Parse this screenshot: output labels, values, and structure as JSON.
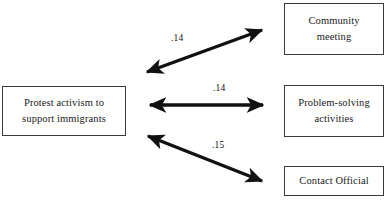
{
  "diagram": {
    "background_color": "#ffffff",
    "line_color": "#111111",
    "box_border_color": "#3a3a3a",
    "nodes": {
      "protest": {
        "line1": "Protest activism to",
        "line2": "support immigrants"
      },
      "community": {
        "line1": "Community",
        "line2": "meeting"
      },
      "problem": {
        "line1": "Problem-solving",
        "line2": "activities"
      },
      "contact": {
        "line1": "Contact Official",
        "line2": ""
      }
    },
    "edges": [
      {
        "id": "protest-community",
        "label": ".14",
        "from": "protest",
        "to": "community",
        "style": "double-headed-arrow",
        "direction": "diagonal-up-right"
      },
      {
        "id": "protest-problem",
        "label": ".14",
        "from": "protest",
        "to": "problem",
        "style": "double-headed-arrow",
        "direction": "horizontal"
      },
      {
        "id": "protest-contact",
        "label": ".15",
        "from": "protest",
        "to": "contact",
        "style": "double-headed-arrow",
        "direction": "diagonal-down-right"
      }
    ]
  }
}
